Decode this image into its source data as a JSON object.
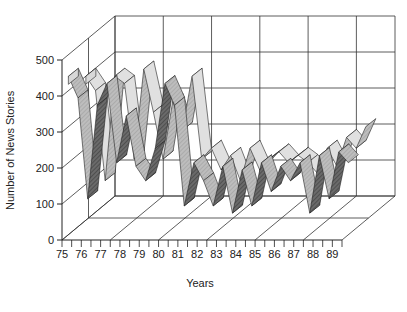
{
  "chart_data": {
    "type": "area",
    "subtype": "3d-ribbon",
    "title": "",
    "xlabel": "Years",
    "ylabel": "Number of News Stories",
    "ylim": [
      0,
      500
    ],
    "yticks": [
      0,
      100,
      200,
      300,
      400,
      500
    ],
    "xtick_labels": [
      "75",
      "76",
      "77",
      "78",
      "79",
      "80",
      "81",
      "82",
      "83",
      "84",
      "85",
      "86",
      "87",
      "88",
      "89"
    ],
    "grid": true,
    "legend": null,
    "x": [
      75,
      75.5,
      76,
      76.5,
      77,
      77.5,
      78,
      78.5,
      79,
      79.5,
      80,
      80.5,
      81,
      81.5,
      82,
      82.5,
      83,
      83.5,
      84,
      84.5,
      85,
      85.5,
      86,
      86.5,
      87,
      87.5,
      88,
      88.5,
      89,
      89.5
    ],
    "series": [
      {
        "name": "Series 1 (front, dark)",
        "color": "#5a5a5a",
        "values": [
          440,
          380,
          100,
          360,
          420,
          200,
          330,
          190,
          150,
          240,
          420,
          360,
          80,
          200,
          150,
          80,
          190,
          60,
          180,
          80,
          200,
          120,
          190,
          150,
          200,
          60,
          220,
          100,
          230,
          200
        ]
      },
      {
        "name": "Series 2 (back, light)",
        "color": "#b4b4b4",
        "values": [
          400,
          360,
          110,
          400,
          380,
          170,
          420,
          300,
          170,
          330,
          250,
          400,
          170,
          200,
          140,
          180,
          110,
          200,
          140,
          170,
          190,
          160,
          180,
          160,
          130,
          200,
          150,
          230,
          200,
          260
        ]
      }
    ]
  },
  "labels": {
    "ylabel": "Number of News Stories",
    "xlabel": "Years"
  }
}
